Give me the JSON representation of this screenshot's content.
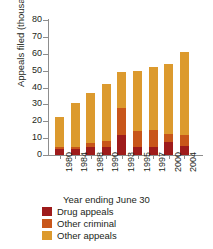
{
  "chart_data": {
    "type": "bar",
    "stacked": true,
    "title": "",
    "xlabel": "Year ending June 30",
    "ylabel": "Appeals filed (thousands)",
    "categories": [
      "1980",
      "1984",
      "1988",
      "1990",
      "1993",
      "1995",
      "1997",
      "2000",
      "2004"
    ],
    "yticks": [
      0,
      10,
      20,
      30,
      40,
      50,
      60,
      70,
      80
    ],
    "ylim": [
      0,
      80
    ],
    "grid": false,
    "legend_position": "bottom-left",
    "series": [
      {
        "name": "Drug appeals",
        "color": "#9e1b1b",
        "values": [
          3.5,
          3.5,
          4.5,
          5.0,
          12.0,
          4.5,
          4.5,
          7.5,
          5.5
        ]
      },
      {
        "name": "Other criminal",
        "color": "#c8561a",
        "values": [
          1.0,
          1.5,
          2.5,
          3.5,
          16.0,
          9.5,
          10.5,
          5.0,
          6.5
        ]
      },
      {
        "name": "Other appeals",
        "color": "#dc9a2e",
        "values": [
          18.0,
          26.0,
          30.0,
          33.5,
          21.0,
          36.0,
          37.0,
          41.5,
          49.0
        ]
      }
    ],
    "totals": [
      22.5,
      31.0,
      37.0,
      42.0,
      49.0,
      50.0,
      52.0,
      54.0,
      61.0
    ]
  }
}
